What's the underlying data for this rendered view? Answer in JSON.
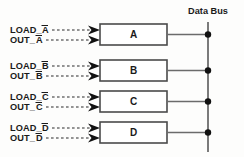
{
  "diagram": {
    "bus": {
      "label": "Data Bus",
      "color": "#5a5a5a",
      "junction_color": "#111111",
      "x": 208,
      "top_y": 22,
      "bottom_y": 152
    },
    "colors": {
      "background": "#fdfdfc",
      "box_border": "#4a4a4a",
      "box_fill": "#ffffff",
      "text": "#1a1a1a",
      "signal_line": "#2b2b2b",
      "output_line": "#6b6b6b"
    },
    "groups": [
      {
        "id": "a",
        "box_label": "A",
        "load_signal": "LOAD_A",
        "load_name": "LOAD",
        "load_reg": "A",
        "out_signal": "OUT_A",
        "out_name": "OUT",
        "out_reg": "A",
        "load_active_low": true,
        "out_active_low": true,
        "box_y": 24,
        "box_height": 21,
        "load_y": 30,
        "out_y": 40
      },
      {
        "id": "b",
        "box_label": "B",
        "load_signal": "LOAD_B",
        "load_name": "LOAD",
        "load_reg": "B",
        "out_signal": "OUT_B",
        "out_name": "OUT",
        "out_reg": "B",
        "load_active_low": true,
        "out_active_low": true,
        "box_y": 60,
        "box_height": 21,
        "load_y": 66,
        "out_y": 76
      },
      {
        "id": "c",
        "box_label": "C",
        "load_signal": "LOAD_C",
        "load_name": "LOAD",
        "load_reg": "C",
        "out_signal": "OUT_C",
        "out_name": "OUT",
        "out_reg": "C",
        "load_active_low": true,
        "out_active_low": true,
        "box_y": 91,
        "box_height": 21,
        "load_y": 97,
        "out_y": 107
      },
      {
        "id": "d",
        "box_label": "D",
        "load_signal": "LOAD_D",
        "load_name": "LOAD",
        "load_reg": "D",
        "out_signal": "OUT_D",
        "out_name": "OUT",
        "out_reg": "D",
        "load_active_low": true,
        "out_active_low": true,
        "box_y": 122,
        "box_height": 21,
        "load_y": 128,
        "out_y": 138
      }
    ],
    "geometry": {
      "label_x": 10,
      "dash_start_x": 48,
      "dash_end_x": 96,
      "box_left": 100,
      "box_right": 167,
      "arrow_tip_x": 100
    }
  }
}
